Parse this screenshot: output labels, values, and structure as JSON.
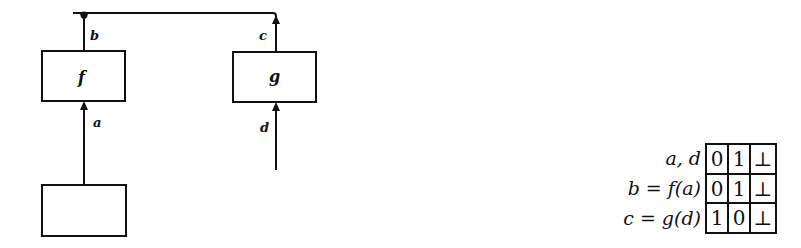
{
  "diagram": {
    "boxes": {
      "f": {
        "label": "f"
      },
      "g": {
        "label": "g"
      },
      "source": {
        "label": ""
      }
    },
    "wires": {
      "a": "a",
      "b": "b",
      "c": "c",
      "d": "d"
    },
    "colors": {
      "stroke": "#111111",
      "background": "#ffffff"
    }
  },
  "legend": {
    "rows": [
      {
        "label": "a, d",
        "values": [
          "0",
          "1",
          "⊥"
        ]
      },
      {
        "label": "b = f(a)",
        "values": [
          "0",
          "1",
          "⊥"
        ]
      },
      {
        "label": "c = g(d)",
        "values": [
          "1",
          "0",
          "⊥"
        ]
      }
    ]
  }
}
